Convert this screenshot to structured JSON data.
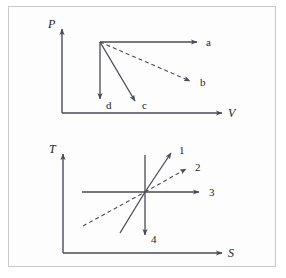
{
  "figure": {
    "background_color": "#fdfdfd",
    "frame_color": "#c9c9c9",
    "line_color": "#4a4a55",
    "text_color": "#222222"
  },
  "diagrams": [
    {
      "id": "pv-diagram",
      "name": "pressure-volume-diagram",
      "y_axis_label": "P",
      "x_axis_label": "V",
      "origin": {
        "x": 62,
        "y": 113
      },
      "vertex": {
        "x": 100,
        "y": 42
      },
      "branches": [
        {
          "label": "a",
          "style": "solid",
          "direction": "right",
          "end_x": 197,
          "end_y": 42,
          "label_x": 206,
          "label_y": 46
        },
        {
          "label": "b",
          "style": "dashed",
          "direction": "down-right",
          "end_x": 190,
          "end_y": 81,
          "label_x": 200,
          "label_y": 86
        },
        {
          "label": "c",
          "style": "solid",
          "direction": "down-right",
          "end_x": 135,
          "end_y": 101,
          "label_x": 142,
          "label_y": 108
        },
        {
          "label": "d",
          "style": "solid",
          "direction": "down",
          "end_x": 100,
          "end_y": 99,
          "label_x": 106,
          "label_y": 108
        }
      ]
    },
    {
      "id": "ts-diagram",
      "name": "temperature-entropy-diagram",
      "y_axis_label": "T",
      "x_axis_label": "S",
      "origin": {
        "x": 63,
        "y": 253
      },
      "vertex": {
        "x": 145,
        "y": 192
      },
      "branches": [
        {
          "label": "1",
          "style": "solid",
          "direction": "up-right",
          "end_x": 172,
          "end_y": 152,
          "label_x": 179,
          "label_y": 153
        },
        {
          "label": "2",
          "style": "dashed",
          "direction": "up-right",
          "end_x": 187,
          "end_y": 168,
          "label_x": 195,
          "label_y": 170
        },
        {
          "label": "3",
          "style": "solid",
          "direction": "right",
          "end_x": 200,
          "end_y": 192,
          "label_x": 209,
          "label_y": 196
        },
        {
          "label": "4",
          "style": "solid",
          "direction": "down",
          "end_x": 145,
          "end_y": 236,
          "label_x": 151,
          "label_y": 241
        }
      ],
      "crossing_lines": [
        {
          "name": "solid-cross-line",
          "x1": 120,
          "y1": 233,
          "x2": 172,
          "y2": 152,
          "style": "solid"
        },
        {
          "name": "dashed-cross-line",
          "x1": 83,
          "y1": 226,
          "x2": 187,
          "y2": 168,
          "style": "dashed"
        },
        {
          "name": "horizontal-cross-line",
          "x1": 82,
          "y1": 192,
          "x2": 200,
          "y2": 192,
          "style": "solid"
        },
        {
          "name": "vertical-cross-line",
          "x1": 145,
          "y1": 155,
          "x2": 145,
          "y2": 236,
          "style": "solid"
        }
      ]
    }
  ]
}
